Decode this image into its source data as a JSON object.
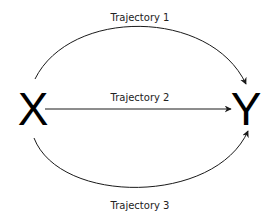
{
  "diagram": {
    "nodes": [
      {
        "id": "X",
        "label": "X"
      },
      {
        "id": "Y",
        "label": "Y"
      }
    ],
    "edges": [
      {
        "from": "X",
        "to": "Y",
        "label": "Trajectory 1",
        "shape": "upper-arc"
      },
      {
        "from": "X",
        "to": "Y",
        "label": "Trajectory 2",
        "shape": "straight"
      },
      {
        "from": "X",
        "to": "Y",
        "label": "Trajectory 3",
        "shape": "lower-arc"
      }
    ],
    "colors": {
      "stroke": "#1a1a1a",
      "text": "#222222",
      "background": "#ffffff"
    }
  }
}
